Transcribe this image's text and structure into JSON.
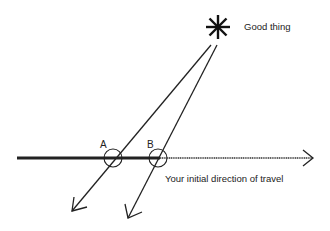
{
  "diagram": {
    "labels": {
      "target": "Good thing",
      "direction": "Your initial direction of travel",
      "point_a": "A",
      "point_b": "B"
    },
    "icons": {
      "target": "asterisk-star-icon"
    },
    "colors": {
      "ink": "#222222",
      "background": "#ffffff"
    }
  }
}
